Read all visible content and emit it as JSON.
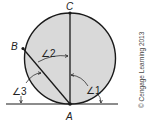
{
  "diagram": {
    "points": {
      "A": "A",
      "B": "B",
      "C": "C"
    },
    "angles": {
      "angle1": "∠1",
      "angle2": "∠2",
      "angle3": "∠3"
    },
    "copyright": "© Cengage Learning 2013",
    "colors": {
      "circle_fill": "#d9d9d9",
      "stroke": "#1a1a1a"
    }
  }
}
